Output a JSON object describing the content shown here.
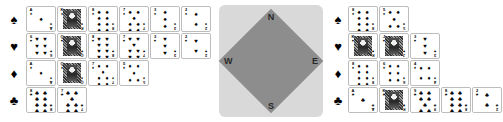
{
  "compass": {
    "north_label": "N",
    "south_label": "S",
    "west_label": "W",
    "east_label": "E",
    "panel_color": "#d9d9d9",
    "diamond_color": "#8d8d8d"
  },
  "suit_glyphs": {
    "spade": "♠",
    "heart": "♥",
    "diamond": "♦",
    "club": "♣"
  },
  "hands": [
    {
      "position": "west",
      "suit_rows": [
        {
          "suit": "spade",
          "marker": "♠",
          "cards": [
            {
              "rank": "A",
              "suit": "♠",
              "kind": "pip",
              "pips": 1
            },
            {
              "rank": "K",
              "suit": "♠",
              "kind": "face"
            },
            {
              "rank": "8",
              "suit": "♠",
              "kind": "pip",
              "pips": 8
            },
            {
              "rank": "7",
              "suit": "♠",
              "kind": "pip",
              "pips": 7
            },
            {
              "rank": "3",
              "suit": "♠",
              "kind": "pip",
              "pips": 3
            },
            {
              "rank": "2",
              "suit": "♠",
              "kind": "pip",
              "pips": 2
            }
          ]
        },
        {
          "suit": "heart",
          "marker": "♥",
          "cards": [
            {
              "rank": "6",
              "suit": "♥",
              "kind": "pip",
              "pips": 6
            },
            {
              "rank": "Q",
              "suit": "♥",
              "kind": "face"
            },
            {
              "rank": "8",
              "suit": "♥",
              "kind": "pip",
              "pips": 8
            },
            {
              "rank": "7",
              "suit": "♥",
              "kind": "pip",
              "pips": 7
            },
            {
              "rank": "3",
              "suit": "♥",
              "kind": "pip",
              "pips": 3
            },
            {
              "rank": "2",
              "suit": "♥",
              "kind": "pip",
              "pips": 2
            }
          ]
        },
        {
          "suit": "diamond",
          "marker": "♦",
          "cards": [
            {
              "rank": "A",
              "suit": "♦",
              "kind": "pip",
              "pips": 1
            },
            {
              "rank": "Q",
              "suit": "♦",
              "kind": "face"
            },
            {
              "rank": "7",
              "suit": "♦",
              "kind": "pip",
              "pips": 7
            },
            {
              "rank": "5",
              "suit": "♦",
              "kind": "pip",
              "pips": 5
            }
          ]
        },
        {
          "suit": "club",
          "marker": "♣",
          "cards": [
            {
              "rank": "8",
              "suit": "♣",
              "kind": "pip",
              "pips": 8
            },
            {
              "rank": "7",
              "suit": "♣",
              "kind": "pip",
              "pips": 7
            }
          ]
        }
      ]
    },
    {
      "position": "east",
      "suit_rows": [
        {
          "suit": "spade",
          "marker": "♠",
          "cards": [
            {
              "rank": "8",
              "suit": "♠",
              "kind": "pip",
              "pips": 8
            },
            {
              "rank": "5",
              "suit": "♠",
              "kind": "pip",
              "pips": 5
            }
          ]
        },
        {
          "suit": "heart",
          "marker": "♥",
          "cards": [
            {
              "rank": "K",
              "suit": "♥",
              "kind": "face"
            },
            {
              "rank": "J",
              "suit": "♥",
              "kind": "face"
            },
            {
              "rank": "3",
              "suit": "♥",
              "kind": "pip",
              "pips": 3
            }
          ]
        },
        {
          "suit": "diamond",
          "marker": "♦",
          "cards": [
            {
              "rank": "8",
              "suit": "♦",
              "kind": "pip",
              "pips": 8
            },
            {
              "rank": "6",
              "suit": "♦",
              "kind": "pip",
              "pips": 6
            },
            {
              "rank": "4",
              "suit": "♦",
              "kind": "pip",
              "pips": 4
            }
          ]
        },
        {
          "suit": "club",
          "marker": "♣",
          "cards": [
            {
              "rank": "A",
              "suit": "♣",
              "kind": "pip",
              "pips": 1
            },
            {
              "rank": "K",
              "suit": "♣",
              "kind": "face"
            },
            {
              "rank": "9",
              "suit": "♣",
              "kind": "pip",
              "pips": 9
            },
            {
              "rank": "8",
              "suit": "♣",
              "kind": "pip",
              "pips": 8
            },
            {
              "rank": "2",
              "suit": "♣",
              "kind": "pip",
              "pips": 2
            }
          ]
        }
      ]
    }
  ]
}
